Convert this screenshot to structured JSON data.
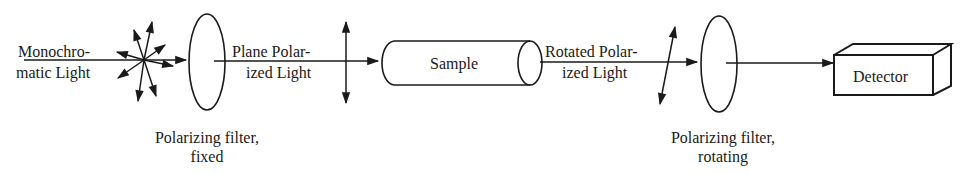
{
  "diagram": {
    "type": "optical polarimeter schematic",
    "labels": {
      "source_line1": "Monochro-",
      "source_line2": "matic Light",
      "plane_line1": "Plane Polar-",
      "plane_line2": "ized Light",
      "sample": "Sample",
      "rotated_line1": "Rotated Polar-",
      "rotated_line2": "ized Light",
      "detector": "Detector",
      "filter1_line1": "Polarizing filter,",
      "filter1_line2": "fixed",
      "filter2_line1": "Polarizing filter,",
      "filter2_line2": "rotating"
    },
    "components": [
      {
        "id": "light-source",
        "label": "Monochromatic Light",
        "icon": "starburst-arrows"
      },
      {
        "id": "filter-fixed",
        "label": "Polarizing filter, fixed",
        "icon": "ellipse-lens"
      },
      {
        "id": "plane-polarized",
        "label": "Plane Polarized Light",
        "icon": "vertical-double-arrow"
      },
      {
        "id": "sample",
        "label": "Sample",
        "icon": "cylinder"
      },
      {
        "id": "rotated-polarized",
        "label": "Rotated Polarized Light",
        "icon": "tilted-double-arrow"
      },
      {
        "id": "filter-rotating",
        "label": "Polarizing filter, rotating",
        "icon": "ellipse-lens"
      },
      {
        "id": "detector",
        "label": "Detector",
        "icon": "3d-box"
      }
    ],
    "stroke_color": "#1a1a1a",
    "background": "#ffffff"
  }
}
